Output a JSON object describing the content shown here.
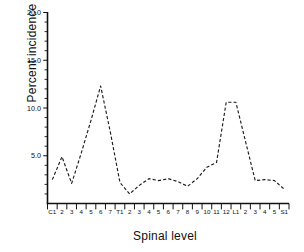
{
  "chart_data": {
    "type": "line",
    "title": "",
    "xlabel": "Spinal level",
    "ylabel": "Percent incidence",
    "categories": [
      "C1",
      "2",
      "3",
      "4",
      "5",
      "6",
      "7",
      "T1",
      "2",
      "3",
      "4",
      "5",
      "6",
      "7",
      "8",
      "9",
      "10",
      "11",
      "12",
      "L1",
      "2",
      "3",
      "4",
      "5",
      "S1"
    ],
    "values": [
      2.5,
      4.9,
      2.1,
      5.3,
      8.7,
      12.3,
      7.5,
      2.2,
      1.0,
      1.9,
      2.6,
      2.4,
      2.6,
      2.3,
      1.8,
      2.6,
      3.8,
      4.3,
      10.6,
      10.6,
      6.5,
      2.4,
      2.5,
      2.4,
      1.5
    ],
    "ylim": [
      0,
      20
    ],
    "xlim": [
      0,
      25
    ],
    "ytick_values": [
      5.0,
      10.0,
      15.0,
      20.0
    ],
    "ytick_labels": [
      "5.0",
      "10.0",
      "15.0",
      "20.0"
    ],
    "yminor_step": 1.0,
    "grid": false,
    "legend": null,
    "legend_position": "none",
    "line_style": "dashed",
    "line_color": "#1d1d1d",
    "markers": false
  },
  "axes": {
    "y_axis_title": "Percent incidence",
    "x_axis_title": "Spinal level"
  },
  "colors": {
    "background": "#ffffff",
    "foreground": "#111111",
    "series": "#1d1d1d"
  }
}
